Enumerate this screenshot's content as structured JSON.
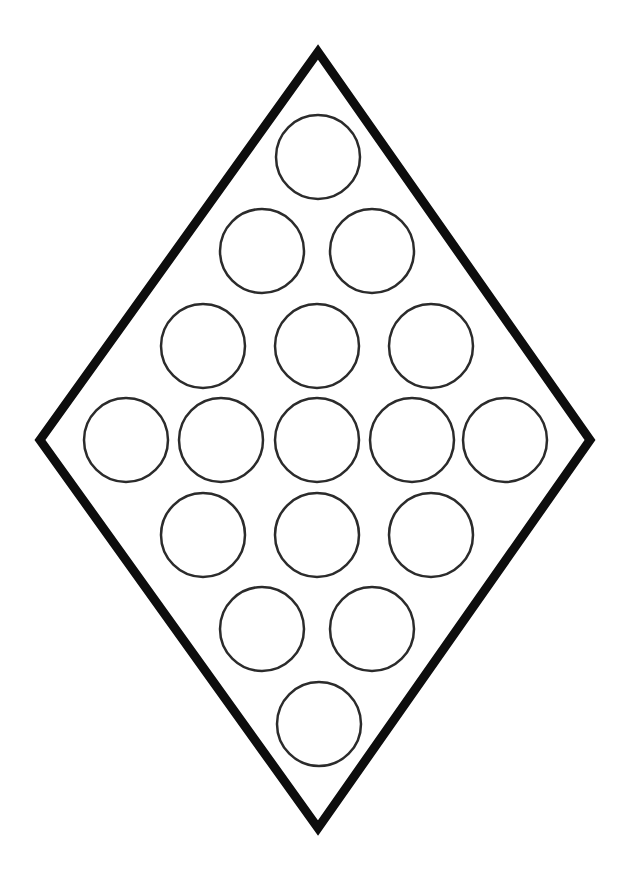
{
  "page": {
    "title": "Diamond Shape Coloring Page",
    "width": 636,
    "height": 889,
    "background_color": "#ffffff"
  },
  "artwork": {
    "name": "diamond-with-circles",
    "description": "Black outline diamond (rhombus) filled with a diamond-arranged grid of sixteen plain circles",
    "stroke_color": "#0d0d0d",
    "fill_color": "#ffffff",
    "circle_stroke_color": "#2b2b2b"
  },
  "diamond": {
    "name": "diamond-outline",
    "stroke_width": 9,
    "stroke_color": "#0d0d0d",
    "fill": "#ffffff",
    "vertices": {
      "top": {
        "x": 318,
        "y": 52
      },
      "right": {
        "x": 590,
        "y": 440
      },
      "bottom": {
        "x": 318,
        "y": 828
      },
      "left": {
        "x": 40,
        "y": 440
      }
    },
    "points": "318,52 590,440 318,828 40,440"
  },
  "circles": {
    "count": 16,
    "radius": 42,
    "diameter": 84,
    "stroke_width": 2.5,
    "stroke_color": "#2b2b2b",
    "fill": "#ffffff",
    "rows": [
      {
        "row": 1,
        "count": 1,
        "cy": 157,
        "cx": [
          318
        ]
      },
      {
        "row": 2,
        "count": 2,
        "cy": 251,
        "cx": [
          262,
          372
        ]
      },
      {
        "row": 3,
        "count": 3,
        "cy": 346,
        "cx": [
          203,
          317,
          431
        ]
      },
      {
        "row": 4,
        "count": 5,
        "cy": 440,
        "cx": [
          126,
          221,
          317,
          412,
          505
        ]
      },
      {
        "row": 5,
        "count": 3,
        "cy": 535,
        "cx": [
          203,
          317,
          431
        ]
      },
      {
        "row": 6,
        "count": 2,
        "cy": 629,
        "cx": [
          262,
          372
        ]
      },
      {
        "row": 7,
        "count": 1,
        "cy": 724,
        "cx": [
          319
        ]
      }
    ]
  }
}
